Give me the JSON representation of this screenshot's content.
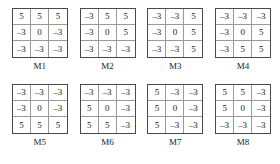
{
  "figure": {
    "kind": "matrix-mask-set",
    "rows_per_matrix": 3,
    "cols_per_matrix": 3,
    "negative_sign": "–",
    "colors": {
      "background": "#ffffff",
      "text": "#1a1a1a",
      "outer_border": "#4a4a4a",
      "inner_gridline": "#9a9a9a"
    }
  },
  "chart_data": {
    "type": "table",
    "title": "",
    "xlabel": "",
    "ylabel": "",
    "layout": {
      "grid_rows": 2,
      "grid_cols": 4,
      "legend": "none",
      "grid": true
    },
    "matrices": [
      {
        "label": "M1",
        "values": [
          [
            5,
            5,
            5
          ],
          [
            -3,
            0,
            -3
          ],
          [
            -3,
            -3,
            -3
          ]
        ],
        "cells": [
          [
            "5",
            "5",
            "5"
          ],
          [
            "–3",
            "0",
            "–3"
          ],
          [
            "–3",
            "–3",
            "–3"
          ]
        ]
      },
      {
        "label": "M2",
        "values": [
          [
            -3,
            5,
            5
          ],
          [
            -3,
            0,
            5
          ],
          [
            -3,
            -3,
            -3
          ]
        ],
        "cells": [
          [
            "–3",
            "5",
            "5"
          ],
          [
            "–3",
            "0",
            "5"
          ],
          [
            "–3",
            "–3",
            "–3"
          ]
        ]
      },
      {
        "label": "M3",
        "values": [
          [
            -3,
            -3,
            5
          ],
          [
            -3,
            0,
            5
          ],
          [
            -3,
            -3,
            5
          ]
        ],
        "cells": [
          [
            "–3",
            "–3",
            "5"
          ],
          [
            "–3",
            "0",
            "5"
          ],
          [
            "–3",
            "–3",
            "5"
          ]
        ]
      },
      {
        "label": "M4",
        "values": [
          [
            -3,
            -3,
            -3
          ],
          [
            -3,
            0,
            5
          ],
          [
            -3,
            5,
            5
          ]
        ],
        "cells": [
          [
            "–3",
            "–3",
            "–3"
          ],
          [
            "–3",
            "0",
            "5"
          ],
          [
            "–3",
            "5",
            "5"
          ]
        ]
      },
      {
        "label": "M5",
        "values": [
          [
            -3,
            -3,
            -3
          ],
          [
            -3,
            0,
            -3
          ],
          [
            5,
            5,
            5
          ]
        ],
        "cells": [
          [
            "–3",
            "–3",
            "–3"
          ],
          [
            "–3",
            "0",
            "–3"
          ],
          [
            "5",
            "5",
            "5"
          ]
        ]
      },
      {
        "label": "M6",
        "values": [
          [
            -3,
            -3,
            -3
          ],
          [
            5,
            0,
            -3
          ],
          [
            5,
            5,
            -3
          ]
        ],
        "cells": [
          [
            "–3",
            "–3",
            "–3"
          ],
          [
            "5",
            "0",
            "–3"
          ],
          [
            "5",
            "5",
            "–3"
          ]
        ]
      },
      {
        "label": "M7",
        "values": [
          [
            5,
            -3,
            -3
          ],
          [
            5,
            0,
            -3
          ],
          [
            5,
            -3,
            -3
          ]
        ],
        "cells": [
          [
            "5",
            "–3",
            "–3"
          ],
          [
            "5",
            "0",
            "–3"
          ],
          [
            "5",
            "–3",
            "–3"
          ]
        ]
      },
      {
        "label": "M8",
        "values": [
          [
            5,
            5,
            -3
          ],
          [
            5,
            0,
            -3
          ],
          [
            -3,
            -3,
            -3
          ]
        ],
        "cells": [
          [
            "5",
            "5",
            "–3"
          ],
          [
            "5",
            "0",
            "–3"
          ],
          [
            "–3",
            "–3",
            "–3"
          ]
        ]
      }
    ]
  }
}
